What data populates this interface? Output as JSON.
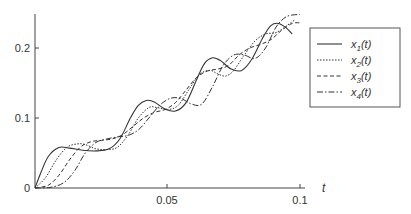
{
  "chart_data": {
    "type": "line",
    "title": "",
    "xlabel": "t",
    "ylabel": "",
    "xlim": [
      0,
      0.1
    ],
    "ylim": [
      0,
      0.25
    ],
    "xticks": [
      "0.05",
      "0.1"
    ],
    "yticks": [
      "0",
      "0.1",
      "0.2"
    ],
    "grid": false,
    "legend_position": "right",
    "series": [
      {
        "name": "x1(t)",
        "style": "solid",
        "x": [
          0,
          0.002,
          0.005,
          0.009,
          0.013,
          0.018,
          0.023,
          0.028,
          0.032,
          0.036,
          0.039,
          0.042,
          0.045,
          0.049,
          0.053,
          0.057,
          0.061,
          0.064,
          0.067,
          0.07,
          0.074,
          0.078,
          0.082,
          0.086,
          0.089,
          0.092,
          0.095,
          0.097
        ],
        "values": [
          0,
          0.02,
          0.045,
          0.058,
          0.057,
          0.054,
          0.053,
          0.056,
          0.07,
          0.1,
          0.118,
          0.125,
          0.123,
          0.113,
          0.11,
          0.122,
          0.155,
          0.178,
          0.186,
          0.182,
          0.17,
          0.168,
          0.185,
          0.215,
          0.232,
          0.235,
          0.228,
          0.22
        ]
      },
      {
        "name": "x2(t)",
        "style": "dotted",
        "x": [
          0,
          0.004,
          0.008,
          0.012,
          0.016,
          0.019,
          0.023,
          0.027,
          0.031,
          0.035,
          0.039,
          0.043,
          0.046,
          0.05,
          0.054,
          0.058,
          0.062,
          0.066,
          0.069,
          0.072,
          0.075,
          0.079,
          0.083,
          0.087,
          0.091,
          0.095,
          0.098
        ],
        "values": [
          0,
          0.015,
          0.04,
          0.058,
          0.063,
          0.062,
          0.056,
          0.055,
          0.058,
          0.075,
          0.1,
          0.115,
          0.115,
          0.112,
          0.118,
          0.14,
          0.162,
          0.168,
          0.163,
          0.16,
          0.168,
          0.19,
          0.21,
          0.22,
          0.222,
          0.232,
          0.24
        ]
      },
      {
        "name": "x3(t)",
        "style": "dashed",
        "x": [
          0,
          0.005,
          0.009,
          0.013,
          0.017,
          0.021,
          0.025,
          0.029,
          0.033,
          0.037,
          0.041,
          0.045,
          0.049,
          0.053,
          0.057,
          0.061,
          0.065,
          0.069,
          0.073,
          0.077,
          0.081,
          0.085,
          0.089,
          0.093,
          0.097,
          0.1
        ],
        "values": [
          0,
          0.004,
          0.018,
          0.04,
          0.058,
          0.066,
          0.068,
          0.07,
          0.076,
          0.088,
          0.1,
          0.108,
          0.112,
          0.122,
          0.14,
          0.158,
          0.167,
          0.17,
          0.175,
          0.19,
          0.2,
          0.205,
          0.212,
          0.225,
          0.235,
          0.236
        ]
      },
      {
        "name": "x4(t)",
        "style": "dashdot",
        "x": [
          0,
          0.006,
          0.011,
          0.015,
          0.019,
          0.023,
          0.027,
          0.031,
          0.035,
          0.039,
          0.043,
          0.047,
          0.051,
          0.055,
          0.059,
          0.063,
          0.067,
          0.071,
          0.075,
          0.079,
          0.083,
          0.087,
          0.091,
          0.095,
          0.1
        ],
        "values": [
          0,
          0.001,
          0.008,
          0.025,
          0.05,
          0.065,
          0.07,
          0.073,
          0.075,
          0.083,
          0.1,
          0.118,
          0.128,
          0.128,
          0.12,
          0.12,
          0.145,
          0.175,
          0.19,
          0.19,
          0.185,
          0.2,
          0.23,
          0.245,
          0.248
        ]
      }
    ]
  },
  "axes": {
    "x_var": "t",
    "x_tick_0": "0.05",
    "x_tick_1": "0.1",
    "y_tick_0": "0",
    "y_tick_1": "0.1",
    "y_tick_2": "0.2"
  },
  "legend": {
    "items": [
      {
        "base": "x",
        "sub": "1",
        "suffix": "(t)"
      },
      {
        "base": "x",
        "sub": "2",
        "suffix": "(t)"
      },
      {
        "base": "x",
        "sub": "3",
        "suffix": "(t)"
      },
      {
        "base": "x",
        "sub": "4",
        "suffix": "(t)"
      }
    ]
  },
  "colors": {
    "line": "#333333",
    "axis": "#444444",
    "background": "#ffffff"
  }
}
